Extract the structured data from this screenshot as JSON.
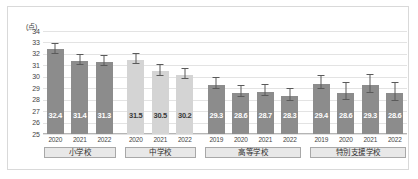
{
  "chart_data": {
    "type": "bar",
    "title": "",
    "subtitle": "",
    "xlabel": "",
    "ylabel": "",
    "unit_label": "(点)",
    "ylim": [
      25,
      34
    ],
    "yticks": [
      25,
      26,
      27,
      28,
      29,
      30,
      31,
      32,
      33,
      34
    ],
    "grid": true,
    "legend": "none",
    "categories": [
      "2020",
      "2021",
      "2022",
      "2020",
      "2021",
      "2022",
      "2019",
      "2020",
      "2021",
      "2022",
      "2019",
      "2020",
      "2021",
      "2022"
    ],
    "values": [
      32.4,
      31.4,
      31.3,
      31.5,
      30.5,
      30.2,
      29.3,
      28.6,
      28.7,
      28.3,
      29.4,
      28.6,
      29.3,
      28.6
    ],
    "error_high": [
      32.9,
      31.9,
      31.8,
      32.0,
      31.0,
      30.7,
      29.9,
      29.2,
      29.3,
      28.9,
      30.1,
      29.5,
      30.2,
      29.5
    ],
    "error_low": [
      32.0,
      31.0,
      30.9,
      31.1,
      30.1,
      29.8,
      28.9,
      28.2,
      28.3,
      27.9,
      28.9,
      28.0,
      28.6,
      27.9
    ],
    "groups": [
      {
        "label": "小学校",
        "start": 0,
        "count": 3,
        "color": "#8c8c8c"
      },
      {
        "label": "中学校",
        "start": 3,
        "count": 3,
        "color": "#d4d4d4"
      },
      {
        "label": "高等学校",
        "start": 6,
        "count": 4,
        "color": "#8c8c8c"
      },
      {
        "label": "特別支援学校",
        "start": 10,
        "count": 4,
        "color": "#8c8c8c"
      }
    ],
    "colors": {
      "bar_dark": "#8c8c8c",
      "bar_light": "#d4d4d4",
      "grid": "#e3e3e3",
      "axis": "#b5b5b5",
      "error": "#5a5a5a",
      "frame": "#d9d9d9",
      "group_box_fill": "#e8e8e8",
      "group_box_border": "#a8a8a8"
    }
  }
}
